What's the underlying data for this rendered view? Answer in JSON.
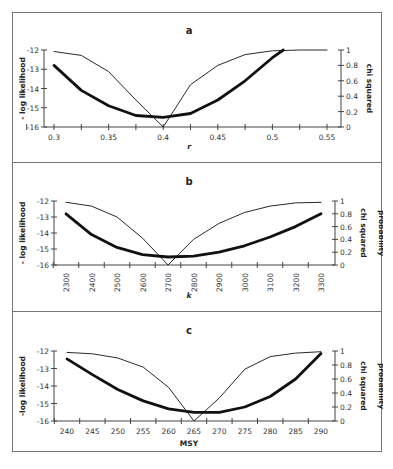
{
  "chart_data": [
    {
      "panel": "a",
      "type": "line",
      "title": "a",
      "xlabel": "r",
      "ylabel_left": "- log likelihood",
      "ylabel_right": "chi squared probability",
      "x_ticks": [
        "0.3",
        "0.35",
        "0.4",
        "0.45",
        "0.5",
        "0.55"
      ],
      "y_left_ticks": [
        "-12",
        "-13",
        "-14",
        "-15",
        "-16"
      ],
      "y_right_ticks": [
        "1",
        "0.8",
        "0.6",
        "0.4",
        "0.2",
        "0"
      ],
      "xlim": [
        0.3,
        0.55
      ],
      "ylim_left": [
        -16,
        -12
      ],
      "ylim_right": [
        0,
        1
      ],
      "series": [
        {
          "name": "- log likelihood",
          "axis": "left",
          "style": "thick",
          "x": [
            0.3,
            0.325,
            0.35,
            0.375,
            0.4,
            0.425,
            0.45,
            0.475,
            0.5,
            0.51
          ],
          "values": [
            -12.8,
            -14.1,
            -14.9,
            -15.4,
            -15.5,
            -15.3,
            -14.6,
            -13.6,
            -12.4,
            -12.0
          ]
        },
        {
          "name": "chi squared probability",
          "axis": "right",
          "style": "thin",
          "x": [
            0.3,
            0.325,
            0.35,
            0.375,
            0.4,
            0.425,
            0.45,
            0.475,
            0.5,
            0.525,
            0.55
          ],
          "values": [
            0.98,
            0.93,
            0.72,
            0.35,
            0.0,
            0.55,
            0.8,
            0.94,
            0.99,
            1.0,
            1.0
          ]
        }
      ]
    },
    {
      "panel": "b",
      "type": "line",
      "title": "b",
      "xlabel": "k",
      "ylabel_left": "- log likelihood",
      "ylabel_right": "chi squared probability",
      "x_ticks": [
        "2300",
        "2400",
        "2500",
        "2600",
        "2700",
        "2800",
        "2900",
        "3000",
        "3100",
        "3200",
        "3300"
      ],
      "y_left_ticks": [
        "-12",
        "-13",
        "-14",
        "-15",
        "-16"
      ],
      "y_right_ticks": [
        "1",
        "0.8",
        "0.6",
        "0.4",
        "0.2",
        "0"
      ],
      "xlim": [
        2300,
        3300
      ],
      "ylim_left": [
        -16,
        -12
      ],
      "ylim_right": [
        0,
        1
      ],
      "series": [
        {
          "name": "- log likelihood",
          "axis": "left",
          "style": "thick",
          "x": [
            2300,
            2400,
            2500,
            2600,
            2700,
            2800,
            2900,
            3000,
            3100,
            3200,
            3300
          ],
          "values": [
            -12.8,
            -14.1,
            -14.9,
            -15.35,
            -15.5,
            -15.45,
            -15.2,
            -14.8,
            -14.25,
            -13.6,
            -12.8
          ]
        },
        {
          "name": "chi squared probability",
          "axis": "right",
          "style": "thin",
          "x": [
            2300,
            2400,
            2500,
            2600,
            2700,
            2800,
            2900,
            3000,
            3100,
            3200,
            3300
          ],
          "values": [
            0.98,
            0.92,
            0.75,
            0.42,
            0.0,
            0.4,
            0.65,
            0.82,
            0.92,
            0.97,
            0.98
          ]
        }
      ]
    },
    {
      "panel": "c",
      "type": "line",
      "title": "c",
      "xlabel": "MSY",
      "ylabel_left": "-log likelihood",
      "ylabel_right": "chi squared probability",
      "x_ticks": [
        "240",
        "245",
        "250",
        "255",
        "260",
        "265",
        "270",
        "275",
        "280",
        "285",
        "290"
      ],
      "y_left_ticks": [
        "-12",
        "-13",
        "-14",
        "-15",
        "-16"
      ],
      "y_right_ticks": [
        "1",
        "0.8",
        "0.6",
        "0.4",
        "0.2",
        "0"
      ],
      "xlim": [
        240,
        290
      ],
      "ylim_left": [
        -16,
        -12
      ],
      "ylim_right": [
        0,
        1
      ],
      "series": [
        {
          "name": "-log likelihood",
          "axis": "left",
          "style": "thick",
          "x": [
            240,
            245,
            250,
            255,
            260,
            265,
            270,
            275,
            280,
            285,
            290
          ],
          "values": [
            -12.45,
            -13.35,
            -14.2,
            -14.85,
            -15.3,
            -15.5,
            -15.5,
            -15.2,
            -14.6,
            -13.6,
            -12.15
          ]
        },
        {
          "name": "chi squared probability",
          "axis": "right",
          "style": "thin",
          "x": [
            240,
            245,
            250,
            255,
            260,
            265,
            270,
            275,
            280,
            285,
            290
          ],
          "values": [
            0.98,
            0.96,
            0.9,
            0.77,
            0.48,
            0.0,
            0.33,
            0.74,
            0.92,
            0.97,
            0.99
          ]
        }
      ]
    }
  ]
}
